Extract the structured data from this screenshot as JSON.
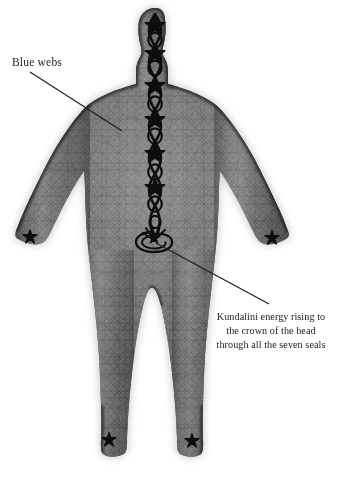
{
  "image": {
    "title": "Kundalini energy body with blue webs",
    "background_color": "#ffffff",
    "ink_color": "#1c1c1c",
    "body_tone": "#4a4a4a"
  },
  "annotations": [
    {
      "id": "blue-webs",
      "text": "Blue webs",
      "lines": [
        "Blue webs"
      ],
      "align": "left",
      "leader_from": {
        "x": 30,
        "y": 72
      },
      "leader_to": {
        "x": 122,
        "y": 131
      }
    },
    {
      "id": "kundalini",
      "text": "Kundalini energy rising to the crown of the head through all the seven seals",
      "lines": [
        "Kundalini energy rising to",
        "the crown of the head",
        "through all the seven seals"
      ],
      "align": "center",
      "leader_from": {
        "x": 269,
        "y": 304
      },
      "leader_to": {
        "x": 155,
        "y": 243
      }
    }
  ],
  "label_blue_webs": {
    "line1": "Blue webs"
  },
  "label_kundalini": {
    "line1": "Kundalini energy rising to",
    "line2": "the crown of the head",
    "line3": "through all the seven seals"
  },
  "figure": {
    "pose": "standing frontal, arms lowered and spread, legs apart",
    "skin_texture": "fine geometric web / mesh lattice covering whole body",
    "glow": "soft dark aura halo around silhouette",
    "seals_count": 7,
    "seal_symbol": "five-pointed star (pentagram)",
    "channel_symbol": "serpentine double-helix rising along the midline",
    "root_symbol": "coiled serpent spiral at base of spine",
    "star_marks": [
      {
        "name": "crown-star",
        "x": 155,
        "y": 26
      },
      {
        "name": "third-eye-star",
        "x": 155,
        "y": 54
      },
      {
        "name": "throat-star",
        "x": 155,
        "y": 80
      },
      {
        "name": "heart-star",
        "x": 155,
        "y": 118
      },
      {
        "name": "solar-plexus-star",
        "x": 155,
        "y": 152
      },
      {
        "name": "sacral-star",
        "x": 155,
        "y": 190
      },
      {
        "name": "root-coil",
        "x": 153,
        "y": 241
      },
      {
        "name": "left-hand-star",
        "x": 30,
        "y": 237
      },
      {
        "name": "right-hand-star",
        "x": 272,
        "y": 238
      },
      {
        "name": "left-foot-star",
        "x": 109,
        "y": 440
      },
      {
        "name": "right-foot-star",
        "x": 192,
        "y": 441
      }
    ]
  }
}
